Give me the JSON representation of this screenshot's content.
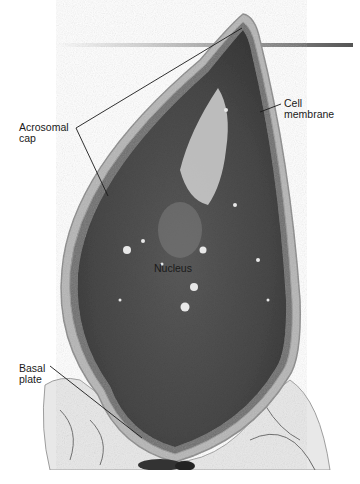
{
  "figure": {
    "labels": {
      "acrosomal_cap": "Acrosomal\ncap",
      "cell_membrane": "Cell\nmembrane",
      "nucleus": "Nucleus",
      "basal_plate": "Basal\nplate"
    },
    "colors": {
      "background": "#ffffff",
      "nucleus_dark": "#4a4a4a",
      "membrane_light": "#b8b8b8",
      "tissue_light": "#e6e6e6",
      "bar_dark": "#5a5a5a"
    }
  }
}
